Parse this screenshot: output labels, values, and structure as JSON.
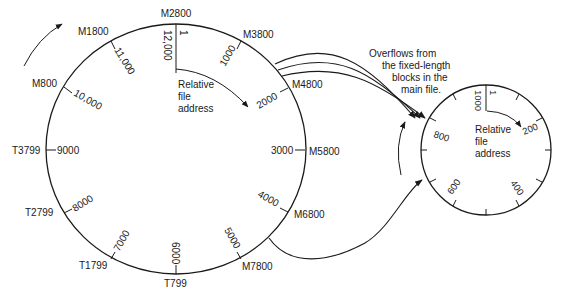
{
  "main_file": {
    "outer_labels": {
      "top": "M2800",
      "m1800": "M1800",
      "m800": "M800",
      "t3799": "T3799",
      "t2799": "T2799",
      "t1799": "T1799",
      "t799": "T799",
      "m3800": "M3800",
      "m4800": "M4800",
      "m5800": "M5800",
      "m6800": "M6800",
      "m7800": "M7800"
    },
    "inner_labels": {
      "start": "1",
      "r12000": "12,000",
      "r11000": "11,000",
      "r10000": "10,000",
      "r9000": "9000",
      "r8000": "8000",
      "r7000": "7000",
      "r6000": "6000",
      "r5000": "5000",
      "r4000": "4000",
      "r3000": "3000",
      "r2000": "2000",
      "r1000": "1000"
    },
    "center_caption": [
      "Relative",
      "file",
      "address"
    ]
  },
  "overflow_file": {
    "inner_labels": {
      "start": "1",
      "r1000": "1000",
      "r200": "200",
      "r400": "400",
      "r600": "600",
      "r800": "800"
    },
    "center_caption": [
      "Relative",
      "file",
      "address"
    ]
  },
  "annotation": {
    "lines": [
      "Overflows from",
      "the fixed-length",
      "blocks in the",
      "main file."
    ]
  }
}
